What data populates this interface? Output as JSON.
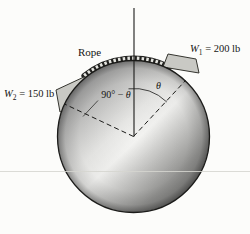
{
  "figure": {
    "rope_label": "Rope",
    "w1": {
      "symbol": "W",
      "sub": "1",
      "rest": " = 200 lb"
    },
    "w2": {
      "symbol": "W",
      "sub": "2",
      "rest": " = 150 lb"
    },
    "theta_label": "θ",
    "complement_angle": {
      "prefix": "90° − ",
      "theta": "θ"
    }
  },
  "colors": {
    "background": "#fcfcfa",
    "line": "#1b1b19",
    "block_fill": "#c9c9c4",
    "block_stroke": "#35352f",
    "rope_dark": "#21211f",
    "rope_light": "#e4e4df",
    "artifact_line": "#d6d6d0"
  }
}
